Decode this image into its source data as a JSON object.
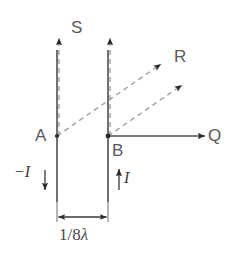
{
  "figure": {
    "colors": {
      "solid_line": "#4d4d4d",
      "dashed_line": "#8c8c8c",
      "arrow_head": "#2b2b2b",
      "label_text": "#58595b",
      "background": "#ffffff"
    },
    "labels": {
      "s": "S",
      "r": "R",
      "q": "Q",
      "a": "A",
      "b": "B",
      "current_left": "−I",
      "current_right": "I",
      "spacing": "1/8",
      "spacing_unit": "λ"
    },
    "elements": {
      "wire_a": "vertical-wire-a",
      "wire_b": "vertical-wire-b",
      "direction_s": "dashed-up-arrow",
      "direction_r": "dashed-diagonal-arrow",
      "direction_q": "solid-horizontal-arrow",
      "dimension": "spacing-dimension-line"
    },
    "geometry": {
      "wire_a_x": 57,
      "wire_b_x": 108,
      "point_y": 136,
      "wire_top_y": 50,
      "wire_bottom_y": 202
    }
  }
}
